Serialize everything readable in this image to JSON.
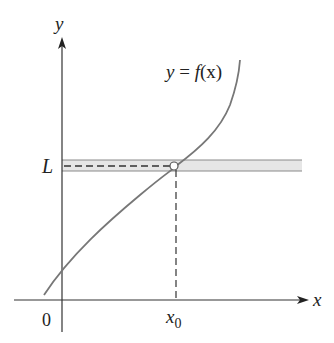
{
  "diagram": {
    "type": "function-limit-illustration",
    "axes": {
      "x_label": "x",
      "y_label": "y",
      "origin_label": "0"
    },
    "curve": {
      "label_prefix": "y = ",
      "label_func": "f",
      "label_arg": "(x)",
      "color": "#777777"
    },
    "limit": {
      "label": "L",
      "band_color": "#e6e6e6",
      "band_border": "#888888"
    },
    "point": {
      "x_label_base": "x",
      "x_label_sub": "0",
      "marker": "open-circle"
    }
  }
}
